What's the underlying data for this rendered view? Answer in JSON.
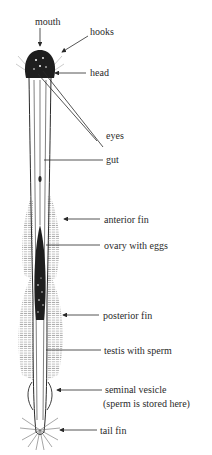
{
  "diagram": {
    "labels": {
      "mouth": "mouth",
      "hooks": "hooks",
      "head": "head",
      "eyes": "eyes",
      "gut": "gut",
      "anterior_fin": "anterior fin",
      "ovary": "ovary with eggs",
      "posterior_fin": "posterior fin",
      "testis": "testis with sperm",
      "seminal_vesicle": "seminal vesicle",
      "seminal_vesicle_note": "(sperm is stored here)",
      "tail_fin": "tail fin"
    },
    "colors": {
      "ink": "#2a2a2a",
      "fin_hatch": "#9a9a9a",
      "background": "#ffffff"
    }
  }
}
